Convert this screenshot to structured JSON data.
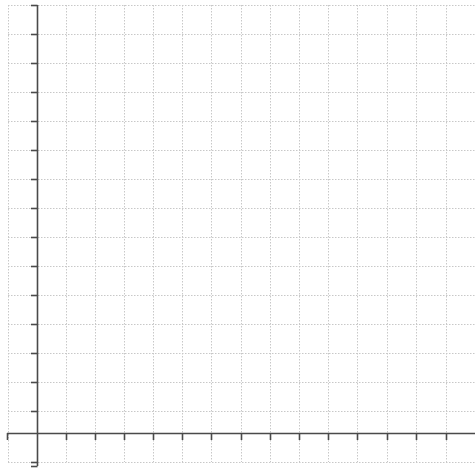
{
  "diagram": {
    "type": "blank coordinate grid",
    "background": "#ffffff",
    "grid_color": "#c8c8c8",
    "axis_color": "#4a4a4a",
    "grid_spacing_px": 29.2,
    "vertical_grid_x": [
      8,
      37,
      66,
      95,
      124,
      153,
      182,
      211,
      241,
      270,
      299,
      328,
      357,
      387,
      416,
      446
    ],
    "horizontal_grid_y": [
      5,
      34,
      63,
      92,
      121,
      150,
      179,
      208,
      237,
      266,
      295,
      324,
      353,
      382,
      411,
      433,
      462
    ],
    "y_axis": {
      "x": 37,
      "y_top": 5,
      "y_bottom": 466,
      "tick_len": 6,
      "tick_side": "left"
    },
    "x_axis": {
      "y": 433,
      "x_left": 7,
      "x_right": 475,
      "tick_len": 7,
      "tick_side": "down"
    },
    "labels": []
  }
}
